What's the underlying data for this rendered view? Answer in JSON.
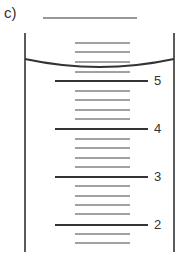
{
  "figure": {
    "part_label": "c)",
    "stroke_color": "#333333",
    "answer_line": {
      "x1": 43,
      "x2": 137,
      "y": 18
    },
    "cylinder": {
      "left_x": 25,
      "right_x": 174,
      "top_y": 33,
      "bottom_y": 252
    },
    "meniscus": {
      "edge_y": 59,
      "lowest_y": 67
    },
    "major_ticks": [
      {
        "label": "5",
        "y": 81
      },
      {
        "label": "4",
        "y": 129
      },
      {
        "label": "3",
        "y": 177
      },
      {
        "label": "2",
        "y": 225
      }
    ],
    "minor_ticks_y": [
      43,
      52,
      62,
      72,
      91,
      100,
      110,
      119,
      139,
      148,
      158,
      167,
      186,
      196,
      205,
      214,
      234,
      243
    ],
    "major_tick_x": [
      55,
      148
    ],
    "minor_tick_x": [
      75,
      130
    ]
  }
}
